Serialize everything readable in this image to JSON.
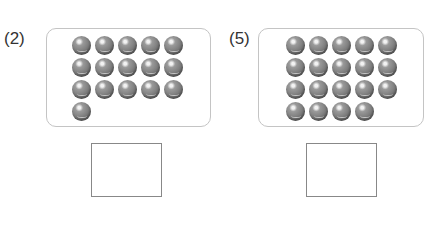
{
  "problems": [
    {
      "label": "(2)",
      "count": 16,
      "rows": [
        5,
        5,
        5,
        1
      ],
      "answer": ""
    },
    {
      "label": "(5)",
      "count": 19,
      "rows": [
        5,
        5,
        5,
        4
      ],
      "answer": ""
    }
  ],
  "colors": {
    "ball": "#7c7c7c",
    "frame_border": "#c4c4c4",
    "answer_border": "#888888"
  }
}
